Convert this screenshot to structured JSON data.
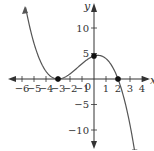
{
  "chart_data": {
    "type": "line",
    "title": "",
    "xlabel": "x",
    "ylabel": "y",
    "xlim": [
      -6.5,
      4.5
    ],
    "ylim": [
      -14,
      14
    ],
    "grid": false,
    "x_ticks": [
      -6,
      -5,
      -4,
      -3,
      -2,
      -1,
      1,
      2,
      3,
      4
    ],
    "x_tick_labels": [
      "-6",
      "-5",
      "-4",
      "-3",
      "-2",
      "-1",
      "1",
      "2",
      "3",
      "4"
    ],
    "y_ticks": [
      10,
      5,
      -5,
      -10
    ],
    "y_tick_labels": [
      "10",
      "5",
      "-5",
      "-10"
    ],
    "origin_label": "0",
    "function": "f(x) = -0.25 (x+3)^2 (x-2)",
    "series": [
      {
        "name": "f(x)",
        "x": [
          -5.7,
          -5.5,
          -5,
          -4.5,
          -4,
          -3.5,
          -3,
          -2.5,
          -2,
          -1.5,
          -1,
          -0.5,
          0,
          0.5,
          1,
          1.5,
          2,
          2.5,
          3,
          3.4
        ],
        "y": [
          13.4,
          11.7,
          7.0,
          3.6,
          1.5,
          0.34,
          0,
          0.28,
          1.0,
          1.97,
          3.0,
          3.91,
          4.5,
          4.59,
          4.0,
          2.53,
          0,
          -3.78,
          -9.0,
          -14.3
        ]
      }
    ],
    "marked_points": [
      {
        "x": -3,
        "y": 0,
        "label": ""
      },
      {
        "x": 0,
        "y": 4.5,
        "label": ""
      },
      {
        "x": 2,
        "y": 0,
        "label": ""
      }
    ],
    "colors": {
      "curve": "#555555",
      "axes": "#333333",
      "points": "#111111"
    }
  }
}
